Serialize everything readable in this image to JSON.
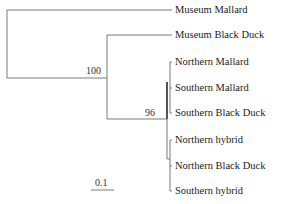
{
  "tree": {
    "type": "phylogenetic-tree",
    "taxa": [
      {
        "label": "Museum Mallard",
        "y": 10
      },
      {
        "label": "Museum Black Duck",
        "y": 35
      },
      {
        "label": "Northern Mallard",
        "y": 62
      },
      {
        "label": "Southern Mallard",
        "y": 88
      },
      {
        "label": "Southern Black Duck",
        "y": 113
      },
      {
        "label": "Northern hybrid",
        "y": 140
      },
      {
        "label": "Northern Black Duck",
        "y": 166
      },
      {
        "label": "Southern hybrid",
        "y": 191
      }
    ],
    "bootstrap": [
      {
        "value": "100",
        "x": 85,
        "y": 66
      },
      {
        "value": "96",
        "x": 145,
        "y": 108
      }
    ],
    "scale_bar": {
      "label": "0.1",
      "length": 0.1
    },
    "colors": {
      "line": "#7a7a7a",
      "dark_line": "#555555"
    }
  }
}
